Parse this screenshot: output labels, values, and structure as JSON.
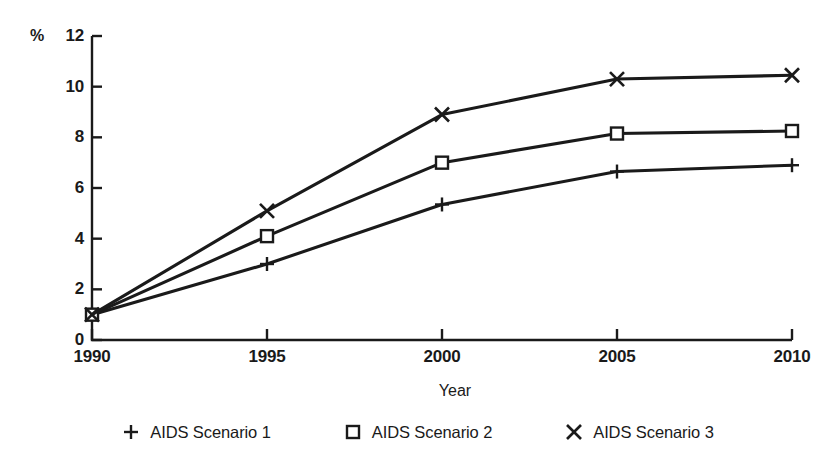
{
  "chart_data": {
    "type": "line",
    "title": "",
    "subtitle": "",
    "xlabel": "Year",
    "ylabel": "%",
    "unit_label": "%",
    "categories": [
      "1990",
      "1995",
      "2000",
      "2005",
      "2010"
    ],
    "x": [
      1990,
      1995,
      2000,
      2005,
      2010
    ],
    "xlim": [
      1990,
      2010
    ],
    "ylim": [
      0,
      12
    ],
    "y_ticks": [
      "0",
      "2",
      "4",
      "6",
      "8",
      "10",
      "12"
    ],
    "y_tick_values": [
      0,
      2,
      4,
      6,
      8,
      10,
      12
    ],
    "x_ticks": [
      "1990",
      "1995",
      "2000",
      "2005",
      "2010"
    ],
    "grid": false,
    "legend_position": "bottom",
    "series": [
      {
        "name": "AIDS Scenario 1",
        "marker": "plus",
        "marker_glyph": "+",
        "color": "#1a1a1a",
        "values": [
          1.0,
          3.0,
          5.35,
          6.65,
          6.9
        ]
      },
      {
        "name": "AIDS Scenario 2",
        "marker": "square",
        "marker_glyph": "□",
        "color": "#1a1a1a",
        "values": [
          1.0,
          4.1,
          7.0,
          8.15,
          8.25
        ]
      },
      {
        "name": "AIDS Scenario 3",
        "marker": "cross",
        "marker_glyph": "×",
        "color": "#1a1a1a",
        "values": [
          1.0,
          5.1,
          8.9,
          10.3,
          10.45
        ]
      }
    ]
  },
  "axes": {
    "y_unit": "%",
    "x_title": "Year",
    "y_tick_labels": [
      "12",
      "10",
      "8",
      "6",
      "4",
      "2",
      "0"
    ],
    "x_tick_labels": [
      "1990",
      "1995",
      "2000",
      "2005",
      "2010"
    ]
  },
  "legend": {
    "entries": [
      {
        "label": "AIDS Scenario 1",
        "glyph": "+"
      },
      {
        "label": "AIDS Scenario 2",
        "glyph": "□"
      },
      {
        "label": "AIDS Scenario 3",
        "glyph": "×"
      }
    ]
  },
  "colors": {
    "ink": "#1a1a1a",
    "background": "#ffffff"
  }
}
